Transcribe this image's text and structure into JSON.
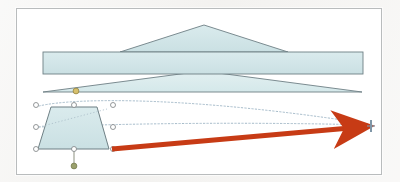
{
  "document": {
    "title": "Shape editing canvas",
    "description": "Vector drawing showing three stacked blue shapes, a selected trapezoid with handles, and a red drag arrow pointing to a target marker"
  },
  "canvas": {
    "background_color": "#ffffff",
    "border_color": "#b9bcbd",
    "page_background": "#f2f1ef",
    "x": 16,
    "y": 8,
    "width": 364,
    "height": 165
  },
  "palette": {
    "shape_fill": "#cfe4e6",
    "shape_fill_light": "#dcecee",
    "shape_stroke": "#6d7f84",
    "arrow_red": "#cc3a12",
    "arrow_red_dark": "#b42f0c",
    "handle_fill": "#ffffff",
    "handle_stroke": "#7b7f82",
    "adjust_handle": "#d8c06a",
    "rotate_handle": "#9aa06a",
    "guide_dash": "#9bb3c4",
    "target_marker": "#7e96a8"
  },
  "shapes": [
    {
      "id": "roof-triangle",
      "name": "Upper triangle",
      "type": "triangle",
      "fill": "#cfe4e6",
      "stroke": "#6d7f84",
      "points": "187,16 271,43 103,43"
    },
    {
      "id": "horizontal-bar",
      "name": "Middle rectangle bar",
      "type": "rectangle",
      "fill": "#cfe4e6",
      "stroke": "#6d7f84",
      "x": 26,
      "y": 43,
      "width": 320,
      "height": 22
    },
    {
      "id": "wide-triangle",
      "name": "Lower wide triangle",
      "type": "triangle",
      "fill": "#dcecee",
      "stroke": "#6d7f84",
      "points": "186,62 345,83 26,83"
    },
    {
      "id": "selected-trapezoid",
      "name": "Selected trapezoid",
      "type": "trapezoid",
      "fill": "#cfe4e6",
      "stroke": "#6d7f84",
      "points": "34,98 80,98 92,140 21,140",
      "selected": true
    }
  ],
  "selection": {
    "name": "Trapezoid selection frame",
    "handle_count": 8,
    "handles": [
      {
        "name": "handle-top-left",
        "cx": 19,
        "cy": 96
      },
      {
        "name": "handle-top-center",
        "cx": 57,
        "cy": 96
      },
      {
        "name": "handle-top-right",
        "cx": 96,
        "cy": 96
      },
      {
        "name": "handle-middle-left",
        "cx": 19,
        "cy": 118
      },
      {
        "name": "handle-middle-right",
        "cx": 96,
        "cy": 118
      },
      {
        "name": "handle-bottom-left",
        "cx": 19,
        "cy": 140
      },
      {
        "name": "handle-bottom-center",
        "cx": 57,
        "cy": 140
      },
      {
        "name": "handle-bottom-right",
        "cx": 96,
        "cy": 140
      }
    ],
    "adjust_handle": {
      "name": "adjust-handle",
      "cx": 59,
      "cy": 82,
      "label": "Yellow adjustment handle"
    },
    "rotate_handle": {
      "name": "rotate-handle",
      "cx": 57,
      "cy": 157,
      "label": "Rotation handle",
      "stem_from_y": 140
    }
  },
  "guides": [
    {
      "name": "guide-upper-curve",
      "path": "M 22,97 C 60,88 180,88 352,115",
      "style": "dotted"
    },
    {
      "name": "guide-lower-line",
      "path": "M 22,118 C 120,114 240,113 352,116",
      "style": "dotted"
    }
  ],
  "drag_arrow": {
    "name": "drag-arrow",
    "color": "#cc3a12",
    "start": {
      "x": 95,
      "y": 140
    },
    "end": {
      "x": 350,
      "y": 117
    },
    "thickness": 5,
    "head_length": 22,
    "head_width": 15,
    "label": "Drag direction arrow"
  },
  "target_marker": {
    "name": "target-marker",
    "x": 354,
    "y": 117,
    "color": "#7e96a8",
    "label": "Drop target crosshair"
  }
}
